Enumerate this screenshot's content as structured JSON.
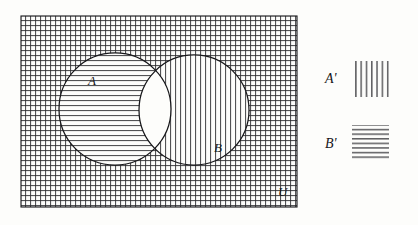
{
  "figure": {
    "kind": "venn-diagram",
    "background_color": "#fdfdfb",
    "ink_color": "#17171a",
    "hatch_color": "#2a2a2e"
  },
  "universe": {
    "label": "U",
    "label_x": 278,
    "label_y": 196,
    "label_size": 13,
    "rect": {
      "x": 21,
      "y": 16,
      "width": 276,
      "height": 191
    },
    "border_color": "#17171a",
    "border_width": 1.1,
    "fill_pattern": "cross-hatch",
    "grid_spacing": 5
  },
  "sets": [
    {
      "name": "A",
      "label": "A",
      "label_x": 88,
      "label_y": 85,
      "label_size": 13,
      "circle": {
        "cx": 115,
        "cy": 109,
        "r": 56
      },
      "region_pattern": "horizontal",
      "region_meaning": "A minus B is hatched with B-prime horizontal lines"
    },
    {
      "name": "B",
      "label": "B",
      "label_x": 214,
      "label_y": 152,
      "label_size": 13,
      "circle": {
        "cx": 194,
        "cy": 110,
        "r": 55
      },
      "region_pattern": "vertical",
      "region_meaning": "B minus A is hatched with A-prime vertical lines"
    }
  ],
  "intersection": {
    "pattern": "blank",
    "meaning": "A intersect B is unshaded"
  },
  "legend": {
    "entries": [
      {
        "label": "A'",
        "pattern": "vertical",
        "label_x": 325,
        "label_y": 83,
        "label_size": 14,
        "swatch": {
          "x": 352,
          "y": 61,
          "width": 37,
          "height": 36
        },
        "line_count": 7
      },
      {
        "label": "B'",
        "pattern": "horizontal",
        "label_x": 325,
        "label_y": 148,
        "label_size": 14,
        "swatch": {
          "x": 352,
          "y": 125,
          "width": 37,
          "height": 36
        },
        "line_count": 8
      }
    ]
  }
}
